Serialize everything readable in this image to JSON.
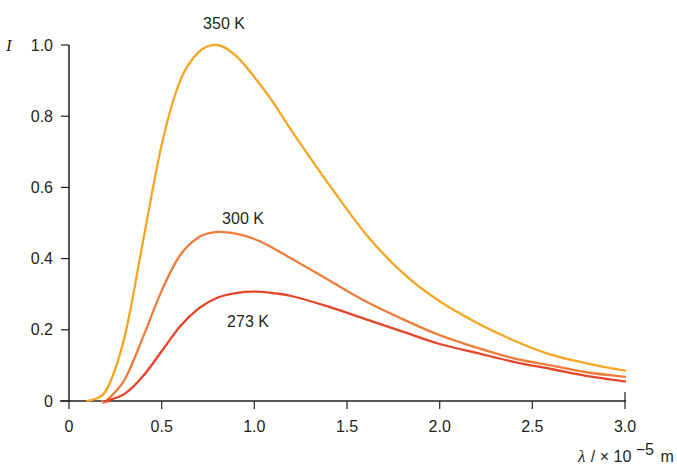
{
  "chart_data": {
    "type": "line",
    "title": "",
    "xlabel": "λ / × 10^-5 m",
    "xlabel_parts": {
      "symbol": "λ",
      "rest": "/ × 10",
      "exp": "−5",
      "unit": "m"
    },
    "ylabel": "I",
    "xlim": [
      0,
      3.0
    ],
    "ylim": [
      0,
      1.0
    ],
    "grid": false,
    "legend": "none (inline labels)",
    "x_ticks": [
      "0",
      "0.5",
      "1.0",
      "1.5",
      "2.0",
      "2.5",
      "3.0"
    ],
    "y_ticks": [
      "0",
      "0.2",
      "0.4",
      "0.6",
      "0.8",
      "1.0"
    ],
    "x": [
      0.1,
      0.2,
      0.3,
      0.4,
      0.5,
      0.6,
      0.7,
      0.8,
      0.9,
      1.0,
      1.1,
      1.2,
      1.4,
      1.6,
      1.8,
      2.0,
      2.2,
      2.4,
      2.6,
      2.8,
      3.0
    ],
    "series": [
      {
        "name": "350 K",
        "color": "#f5a623",
        "values": [
          0.0,
          0.03,
          0.18,
          0.45,
          0.72,
          0.9,
          0.98,
          1.0,
          0.97,
          0.91,
          0.84,
          0.76,
          0.61,
          0.47,
          0.36,
          0.28,
          0.22,
          0.17,
          0.13,
          0.105,
          0.085
        ]
      },
      {
        "name": "300 K",
        "color": "#ef7d3a",
        "values": [
          0.0,
          0.0,
          0.06,
          0.18,
          0.31,
          0.41,
          0.46,
          0.475,
          0.47,
          0.455,
          0.43,
          0.4,
          0.34,
          0.28,
          0.23,
          0.185,
          0.15,
          0.12,
          0.1,
          0.08,
          0.068
        ]
      },
      {
        "name": "273 K",
        "color": "#e5452a",
        "values": [
          0.0,
          0.0,
          0.02,
          0.07,
          0.14,
          0.21,
          0.26,
          0.29,
          0.303,
          0.307,
          0.303,
          0.295,
          0.265,
          0.23,
          0.195,
          0.16,
          0.135,
          0.11,
          0.09,
          0.07,
          0.055
        ]
      }
    ],
    "annotations": [
      {
        "text": "350 K",
        "x": 0.83,
        "y": 1.04
      },
      {
        "text": "300 K",
        "x": 0.97,
        "y": 0.51
      },
      {
        "text": "273 K",
        "x": 1.0,
        "y": 0.22
      }
    ]
  }
}
